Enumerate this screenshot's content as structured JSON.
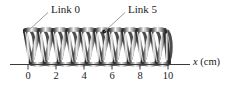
{
  "figure": {
    "background_color": "#ffffff"
  },
  "annotations": [
    {
      "id": "link0",
      "label": "Link 0",
      "leader_from": [
        48,
        12
      ],
      "leader_to": [
        28,
        30
      ],
      "target_coil_index": 0
    },
    {
      "id": "link5",
      "label": "Link 5",
      "leader_from": [
        125,
        12
      ],
      "leader_to": [
        104,
        31
      ],
      "target_coil_index": 5
    }
  ],
  "axis": {
    "label": "x (cm)",
    "variable": "x",
    "units": "(cm)",
    "line_start_x": 10,
    "line_end_x": 190,
    "line_y": 64,
    "ticks": [
      {
        "value": 0,
        "label": "0",
        "px": 28
      },
      {
        "value": 1,
        "label": "",
        "px": 42
      },
      {
        "value": 2,
        "label": "2",
        "px": 56
      },
      {
        "value": 3,
        "label": "",
        "px": 70
      },
      {
        "value": 4,
        "label": "4",
        "px": 84
      },
      {
        "value": 5,
        "label": "",
        "px": 98
      },
      {
        "value": 6,
        "label": "6",
        "px": 112
      },
      {
        "value": 7,
        "label": "",
        "px": 126
      },
      {
        "value": 8,
        "label": "8",
        "px": 140
      },
      {
        "value": 9,
        "label": "",
        "px": 154
      },
      {
        "value": 10,
        "label": "10",
        "px": 168
      }
    ],
    "major_tick_values": [
      0,
      2,
      4,
      6,
      8,
      10
    ]
  },
  "spring": {
    "coil_count": 11,
    "x_start_px": 24,
    "x_end_px": 170,
    "top_px": 30,
    "bottom_px": 64,
    "edge_color": "#2e2e2e",
    "highlight_color": "#f2f2f2",
    "mid_color": "#9a9a9a"
  },
  "colors": {
    "ink": "#1a1a1a",
    "leader_line": "#8c8c8c",
    "axis": "#3a3a3a"
  }
}
